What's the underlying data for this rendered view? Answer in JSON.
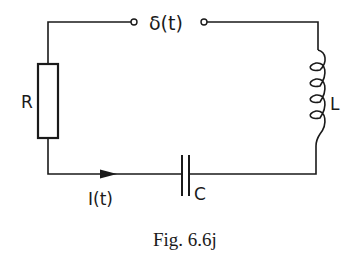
{
  "diagram": {
    "type": "circuit",
    "source": {
      "label": "δ(t)"
    },
    "components": [
      {
        "id": "resistor",
        "label": "R"
      },
      {
        "id": "inductor",
        "label": "L"
      },
      {
        "id": "capacitor",
        "label": "C"
      }
    ],
    "current": {
      "label": "I(t)"
    },
    "caption": "Fig. 6.6j"
  }
}
